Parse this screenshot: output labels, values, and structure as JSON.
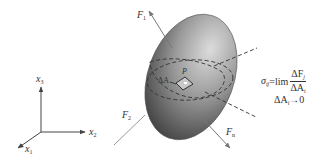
{
  "diagram": {
    "axes": {
      "x1": {
        "label": "x",
        "sub": "1"
      },
      "x2": {
        "label": "x",
        "sub": "2"
      },
      "x3": {
        "label": "x",
        "sub": "3"
      }
    },
    "forces": {
      "F1": {
        "label": "F",
        "sub": "1"
      },
      "F2": {
        "label": "F",
        "sub": "2"
      },
      "Fn": {
        "label": "F",
        "sub": "n"
      }
    },
    "point": {
      "label": "P"
    },
    "area": {
      "label": "ΔA"
    },
    "formula": {
      "lhs": "σ",
      "lhs_sub": "ij",
      "equals": "=",
      "op": "lim",
      "num": "ΔF",
      "num_sub": "j",
      "den": "ΔA",
      "den_sub": "i",
      "cond": "ΔA",
      "cond_sub": "i",
      "cond_arrow": "→0"
    },
    "colors": {
      "ellipsoid_light": "#d6d6d6",
      "ellipsoid_dark": "#3a3a3a",
      "lines": "#555555",
      "text": "#333333"
    }
  }
}
